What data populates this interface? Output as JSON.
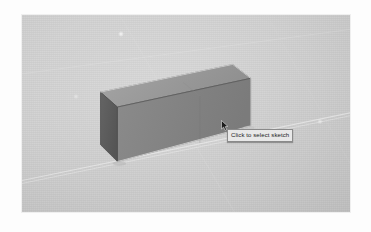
{
  "app": {
    "name": "cad-3d-viewport",
    "canvas_background": "#cfcfcf",
    "frame_background": "#fdfdfd"
  },
  "viewport": {
    "label": "3D modeling viewport",
    "x": 21,
    "y": 14,
    "width": 330,
    "height": 199,
    "grid_visible": true,
    "grid_line_color": "#e3e3e3",
    "orientation": "isometric"
  },
  "model": {
    "name": "rectangular-prism",
    "description": "Extruded rectangular block",
    "faces": {
      "top": {
        "label": "top-face",
        "color": "#9b9b9b"
      },
      "front": {
        "label": "front-face",
        "color": "#838383"
      },
      "left_end": {
        "label": "left-end-face",
        "color": "#5e5e5e"
      }
    },
    "edge_color": "#4a4a4a",
    "highlight_edge_color": "#f4f4f4",
    "seam_visible": true
  },
  "tooltip": {
    "text": "Click to select sketch",
    "background": "#e8e8e8",
    "border_color": "#8a8a8a",
    "text_color": "#1a1a1a",
    "x": 227,
    "y": 129
  },
  "cursor": {
    "type": "arrow-pointer",
    "x": 221,
    "y": 120
  },
  "select_point": {
    "label": "selection-point",
    "x": 223,
    "y": 124,
    "color": "#202020"
  },
  "speckles": [
    {
      "label": "highlight-speck-1",
      "x": 117,
      "y": 30,
      "size": 6,
      "opacity": 0.55
    },
    {
      "label": "highlight-speck-2",
      "x": 72,
      "y": 93,
      "size": 5,
      "opacity": 0.3
    },
    {
      "label": "highlight-speck-3",
      "x": 316,
      "y": 118,
      "size": 5,
      "opacity": 0.38
    }
  ]
}
